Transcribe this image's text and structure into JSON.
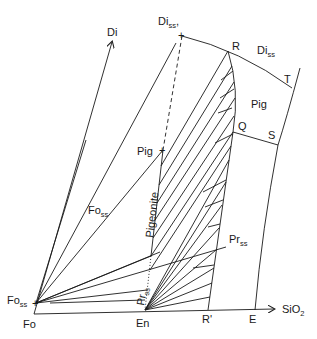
{
  "diagram": {
    "type": "phase-diagram",
    "labels": {
      "di": "Di",
      "di_ss_top": {
        "base": "Di",
        "sub": "ss"
      },
      "di_ss_right": {
        "base": "Di",
        "sub": "ss"
      },
      "r": "R",
      "t": "T",
      "pig_field": "Pig",
      "q": "Q",
      "s": "S",
      "pig_point": "Pig",
      "fo_ss_mid": {
        "base": "Fo",
        "sub": "ss"
      },
      "pigeonite": "Pigeonite",
      "pr_ss_right": {
        "base": "Pr",
        "sub": "ss"
      },
      "pr_ss_bottom": {
        "base": "Pr",
        "sub": "ss"
      },
      "fo_ss_left": {
        "base": "Fo",
        "sub": "ss"
      },
      "fo": "Fo",
      "en": "En",
      "r_prime": "R'",
      "e": "E",
      "sio2": {
        "base": "SiO",
        "sub": "2"
      }
    },
    "axes": [
      "Fo",
      "Di",
      "SiO2"
    ],
    "points": [
      "Fo",
      "Fo_ss",
      "En",
      "Pr_ss",
      "Pig",
      "Di_ss",
      "R",
      "Q",
      "R'",
      "S",
      "T",
      "E"
    ]
  }
}
